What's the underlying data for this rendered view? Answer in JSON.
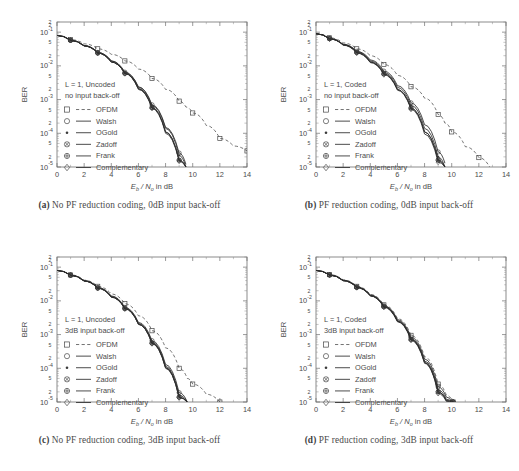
{
  "figure": {
    "axis": {
      "xlabel_main": "E",
      "xlabel_sub": "b",
      "xlabel_mid": " / N",
      "xlabel_sub2": "o",
      "xlabel_tail": " in dB",
      "ylabel": "BER",
      "xticks": [
        "0",
        "2",
        "4",
        "6",
        "8",
        "10",
        "12",
        "14"
      ],
      "yticks": [
        "10",
        "10",
        "10",
        "10",
        "10"
      ],
      "yexps": [
        "-1",
        "-2",
        "-3",
        "-4",
        "-5"
      ],
      "yminor": [
        "5",
        "2"
      ],
      "ytop_minor": "2"
    },
    "legend": [
      {
        "label": "OFDM",
        "marker": "square",
        "style": "dashed"
      },
      {
        "label": "Walsh",
        "marker": "circle",
        "style": "solid"
      },
      {
        "label": "OGold",
        "marker": "star",
        "style": "solid"
      },
      {
        "label": "Zadoff",
        "marker": "circle-x",
        "style": "solid"
      },
      {
        "label": "Frank",
        "marker": "circle-plus",
        "style": "solid"
      },
      {
        "label": "Complementary",
        "marker": "diamond",
        "style": "solid"
      }
    ],
    "panels": [
      {
        "id": "a",
        "caption_label": "(a)",
        "caption_text": "No PF reduction coding, 0dB input back-off",
        "annotation_line1": "L = 1, Uncoded",
        "annotation_line2": "no input back-off"
      },
      {
        "id": "b",
        "caption_label": "(b)",
        "caption_text": "PF reduction coding, 0dB input back-off",
        "annotation_line1": "L = 1, Coded",
        "annotation_line2": "no input back-off"
      },
      {
        "id": "c",
        "caption_label": "(c)",
        "caption_text": "No PF reduction coding, 3dB input back-off",
        "annotation_line1": "L = 1, Uncoded",
        "annotation_line2": "3dB input back-off"
      },
      {
        "id": "d",
        "caption_label": "(d)",
        "caption_text": "PF reduction coding, 3dB input back-off",
        "annotation_line1": "L = 1, Coded",
        "annotation_line2": "3dB input back-off"
      }
    ]
  },
  "chart_data": [
    {
      "type": "line",
      "panel": "a",
      "title": "No PF reduction coding, 0dB input back-off",
      "xlabel": "Eb / No in dB",
      "ylabel": "BER",
      "xlim": [
        0,
        14
      ],
      "ylim": [
        1e-05,
        0.2
      ],
      "yscale": "log",
      "grid": false,
      "legend_position": "inside-left",
      "x": [
        0,
        1,
        2,
        3,
        4,
        5,
        6,
        7,
        8,
        9,
        9.5,
        10,
        11,
        12,
        13,
        14
      ],
      "series": [
        {
          "name": "OFDM",
          "marker": "square",
          "style": "dashed",
          "values": [
            0.08,
            0.06,
            0.045,
            0.032,
            0.022,
            0.014,
            0.008,
            0.0042,
            0.002,
            0.0009,
            0.0006,
            0.0004,
            0.00017,
            7e-05,
            4.2e-05,
            3e-05
          ]
        },
        {
          "name": "Walsh",
          "marker": "circle",
          "style": "solid",
          "values": [
            0.08,
            0.058,
            0.04,
            0.025,
            0.014,
            0.0065,
            0.0024,
            0.0007,
            0.00015,
            2.6e-05,
            1.2e-05,
            null,
            null,
            null,
            null,
            null
          ]
        },
        {
          "name": "OGold",
          "marker": "star",
          "style": "solid",
          "values": [
            0.08,
            0.058,
            0.04,
            0.025,
            0.014,
            0.0064,
            0.0023,
            0.00066,
            0.00014,
            2.2e-05,
            1e-05,
            null,
            null,
            null,
            null,
            null
          ]
        },
        {
          "name": "Zadoff",
          "marker": "circle-x",
          "style": "solid",
          "values": [
            0.08,
            0.057,
            0.039,
            0.024,
            0.013,
            0.006,
            0.0021,
            0.00058,
            0.00011,
            1.6e-05,
            1e-05,
            null,
            null,
            null,
            null,
            null
          ]
        },
        {
          "name": "Frank",
          "marker": "circle-plus",
          "style": "solid",
          "values": [
            0.08,
            0.057,
            0.039,
            0.024,
            0.013,
            0.006,
            0.0021,
            0.00058,
            0.00011,
            1.6e-05,
            1e-05,
            null,
            null,
            null,
            null,
            null
          ]
        },
        {
          "name": "Complementary",
          "marker": "diamond",
          "style": "solid",
          "values": [
            0.08,
            0.057,
            0.039,
            0.024,
            0.013,
            0.0059,
            0.002,
            0.00055,
            0.0001,
            1.5e-05,
            1e-05,
            null,
            null,
            null,
            null,
            null
          ]
        }
      ]
    },
    {
      "type": "line",
      "panel": "b",
      "title": "PF reduction coding, 0dB input back-off",
      "xlabel": "Eb / No in dB",
      "ylabel": "BER",
      "xlim": [
        0,
        14
      ],
      "ylim": [
        1e-05,
        0.2
      ],
      "yscale": "log",
      "grid": false,
      "legend_position": "inside-left",
      "x": [
        0,
        1,
        2,
        3,
        4,
        5,
        6,
        7,
        8,
        9,
        9.5,
        10,
        11,
        12,
        12.8
      ],
      "series": [
        {
          "name": "OFDM",
          "marker": "square",
          "style": "dashed",
          "values": [
            0.09,
            0.068,
            0.048,
            0.032,
            0.02,
            0.011,
            0.0052,
            0.0024,
            0.0011,
            0.00036,
            0.0002,
            0.00011,
            4e-05,
            1.9e-05,
            1e-05
          ]
        },
        {
          "name": "Walsh",
          "marker": "circle",
          "style": "solid",
          "values": [
            0.09,
            0.065,
            0.044,
            0.027,
            0.015,
            0.007,
            0.0026,
            0.0008,
            0.00018,
            2.8e-05,
            1.3e-05,
            null,
            null,
            null,
            null
          ]
        },
        {
          "name": "OGold",
          "marker": "star",
          "style": "solid",
          "values": [
            0.09,
            0.064,
            0.043,
            0.026,
            0.014,
            0.0064,
            0.0023,
            0.00068,
            0.00014,
            2e-05,
            1e-05,
            null,
            null,
            null,
            null
          ]
        },
        {
          "name": "Zadoff",
          "marker": "circle-x",
          "style": "solid",
          "values": [
            0.09,
            0.064,
            0.042,
            0.025,
            0.013,
            0.0058,
            0.002,
            0.00056,
            0.00011,
            1.6e-05,
            1e-05,
            null,
            null,
            null,
            null
          ]
        },
        {
          "name": "Frank",
          "marker": "circle-plus",
          "style": "solid",
          "values": [
            0.09,
            0.064,
            0.042,
            0.025,
            0.013,
            0.0058,
            0.002,
            0.00056,
            0.00011,
            1.6e-05,
            1e-05,
            null,
            null,
            null,
            null
          ]
        },
        {
          "name": "Complementary",
          "marker": "diamond",
          "style": "solid",
          "values": [
            0.09,
            0.063,
            0.041,
            0.024,
            0.0125,
            0.0055,
            0.0019,
            0.00052,
            9.5e-05,
            1.4e-05,
            1e-05,
            null,
            null,
            null,
            null
          ]
        }
      ]
    },
    {
      "type": "line",
      "panel": "c",
      "title": "No PF reduction coding, 3dB input back-off",
      "xlabel": "Eb / No in dB",
      "ylabel": "BER",
      "xlim": [
        0,
        14
      ],
      "ylim": [
        1e-05,
        0.2
      ],
      "yscale": "log",
      "grid": false,
      "legend_position": "inside-left",
      "x": [
        0,
        1,
        2,
        3,
        4,
        5,
        6,
        7,
        8,
        9,
        9.6,
        10,
        11,
        12
      ],
      "series": [
        {
          "name": "OFDM",
          "marker": "square",
          "style": "dashed",
          "values": [
            0.08,
            0.059,
            0.041,
            0.027,
            0.016,
            0.0082,
            0.0036,
            0.0013,
            0.0004,
            0.0001,
            5e-05,
            3.4e-05,
            1.7e-05,
            1e-05
          ]
        },
        {
          "name": "Walsh",
          "marker": "circle",
          "style": "solid",
          "values": [
            0.08,
            0.058,
            0.04,
            0.025,
            0.014,
            0.0064,
            0.0023,
            0.00066,
            0.00013,
            1.9e-05,
            1e-05,
            null,
            null,
            null
          ]
        },
        {
          "name": "OGold",
          "marker": "star",
          "style": "solid",
          "values": [
            0.08,
            0.058,
            0.039,
            0.024,
            0.0135,
            0.0061,
            0.00215,
            0.0006,
            0.000115,
            1.6e-05,
            1e-05,
            null,
            null,
            null
          ]
        },
        {
          "name": "Zadoff",
          "marker": "circle-x",
          "style": "solid",
          "values": [
            0.08,
            0.058,
            0.039,
            0.024,
            0.013,
            0.0059,
            0.00205,
            0.00056,
            0.000105,
            1.4e-05,
            1e-05,
            null,
            null,
            null
          ]
        },
        {
          "name": "Frank",
          "marker": "circle-plus",
          "style": "solid",
          "values": [
            0.08,
            0.058,
            0.039,
            0.024,
            0.013,
            0.0059,
            0.00205,
            0.00056,
            0.000105,
            1.4e-05,
            1e-05,
            null,
            null,
            null
          ]
        },
        {
          "name": "Complementary",
          "marker": "diamond",
          "style": "solid",
          "values": [
            0.08,
            0.057,
            0.0385,
            0.0235,
            0.0128,
            0.0058,
            0.002,
            0.00054,
            0.0001,
            1.35e-05,
            1e-05,
            null,
            null,
            null
          ]
        }
      ]
    },
    {
      "type": "line",
      "panel": "d",
      "title": "PF reduction coding, 3dB input back-off",
      "xlabel": "Eb / No in dB",
      "ylabel": "BER",
      "xlim": [
        0,
        14
      ],
      "ylim": [
        1e-05,
        0.2
      ],
      "yscale": "log",
      "grid": false,
      "legend_position": "inside-left",
      "x": [
        0,
        1,
        2,
        3,
        4,
        5,
        6,
        7,
        8,
        9,
        9.6,
        10.1
      ],
      "series": [
        {
          "name": "OFDM",
          "marker": "square",
          "style": "dashed",
          "values": [
            0.08,
            0.06,
            0.042,
            0.027,
            0.0155,
            0.0076,
            0.003,
            0.00095,
            0.00022,
            3.4e-05,
            1.6e-05,
            1e-05
          ]
        },
        {
          "name": "Walsh",
          "marker": "circle",
          "style": "solid",
          "values": [
            0.08,
            0.059,
            0.041,
            0.026,
            0.015,
            0.0072,
            0.0028,
            0.00084,
            0.00019,
            2.8e-05,
            1.4e-05,
            1e-05
          ]
        },
        {
          "name": "OGold",
          "marker": "star",
          "style": "solid",
          "values": [
            0.08,
            0.059,
            0.04,
            0.0255,
            0.0145,
            0.0069,
            0.0026,
            0.00076,
            0.000165,
            2.3e-05,
            1.2e-05,
            1e-05
          ]
        },
        {
          "name": "Zadoff",
          "marker": "circle-x",
          "style": "solid",
          "values": [
            0.08,
            0.0585,
            0.04,
            0.025,
            0.0142,
            0.0067,
            0.0025,
            0.00072,
            0.00015,
            2e-05,
            1.1e-05,
            1e-05
          ]
        },
        {
          "name": "Frank",
          "marker": "circle-plus",
          "style": "solid",
          "values": [
            0.08,
            0.0585,
            0.04,
            0.025,
            0.0142,
            0.0067,
            0.0025,
            0.00072,
            0.00015,
            2e-05,
            1.1e-05,
            1e-05
          ]
        },
        {
          "name": "Complementary",
          "marker": "diamond",
          "style": "solid",
          "values": [
            0.08,
            0.058,
            0.0395,
            0.0248,
            0.014,
            0.0065,
            0.0024,
            0.00068,
            0.00014,
            1.8e-05,
            1.05e-05,
            1e-05
          ]
        }
      ]
    }
  ]
}
